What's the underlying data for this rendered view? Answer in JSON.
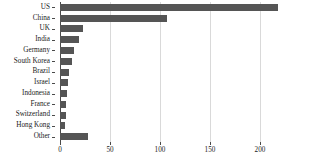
{
  "chart_data": {
    "type": "bar",
    "orientation": "horizontal",
    "title": "",
    "subtitle": "",
    "xlabel": "",
    "ylabel": "",
    "categories": [
      "US",
      "China",
      "UK",
      "India",
      "Germany",
      "South Korea",
      "Brazil",
      "Israel",
      "Indonesia",
      "France",
      "Switzerland",
      "Hong Kong",
      "Other"
    ],
    "values": [
      218,
      107,
      23,
      19,
      14,
      12,
      9,
      8,
      7,
      6,
      6,
      5,
      28
    ],
    "xlim": [
      0,
      229
    ],
    "xticks": [
      0,
      50,
      100,
      150,
      200
    ],
    "xticklabels": [
      "0",
      "50",
      "100",
      "150",
      "200"
    ],
    "grid": true,
    "grid_axis": "x",
    "legend": null,
    "bar_color": "#555555",
    "grid_color": "#d9d9d9",
    "axis_color": "#4a4a4a",
    "background": "#ffffff"
  }
}
